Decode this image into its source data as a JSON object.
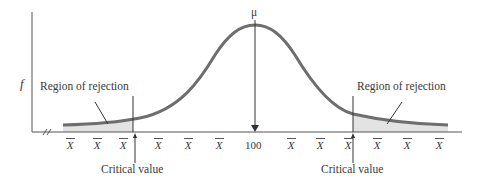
{
  "diagram": {
    "y_axis_label": "f",
    "mean_label": "μ",
    "mean_value": "100",
    "left_region_label": "Region of rejection",
    "right_region_label": "Region of rejection",
    "left_critical_label": "Critical value",
    "right_critical_label": "Critical value",
    "x_tick_symbol": "X",
    "x_ticks": [
      "X",
      "X",
      "X",
      "X",
      "X",
      "X",
      "100",
      "X",
      "X",
      "X",
      "X",
      "X",
      "X"
    ],
    "colors": {
      "curve": "#6e6e6e",
      "shade": "#e3e3e3",
      "axis": "#555555"
    }
  }
}
